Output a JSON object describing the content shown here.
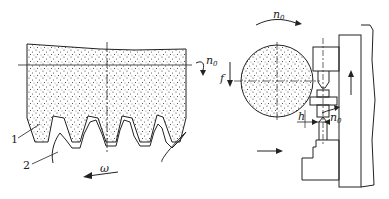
{
  "diagram": {
    "left_panel": {
      "description": "Formed grinding wheel engaging gear teeth",
      "labels": {
        "part1": "1",
        "part2": "2",
        "wheel_speed": "n",
        "wheel_speed_sub": "0",
        "gear_rotation": "ω"
      }
    },
    "right_panel": {
      "description": "Grinding wheel on machine with workpiece between centers",
      "labels": {
        "wheel_speed": "n",
        "wheel_speed_sub": "0",
        "feed": "f",
        "depth": "h",
        "work_speed": "n",
        "work_speed_sub": "0"
      }
    },
    "colors": {
      "line": "#222222",
      "background": "#ffffff"
    }
  }
}
